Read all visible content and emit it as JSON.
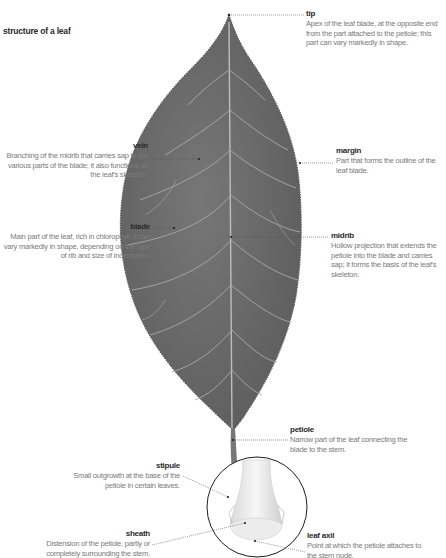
{
  "title": "structure of a leaf",
  "labels": {
    "tip": {
      "term": "tip",
      "desc": "Apex of the leaf blade, at the opposite end from the part attached to the petiole; this part can vary markedly in shape."
    },
    "margin": {
      "term": "margin",
      "desc": "Part that forms the outline of the leaf blade."
    },
    "vein": {
      "term": "vein",
      "desc": "Branching of the midrib that carries sap to the various parts of the blade; it also functions as the leaf's skeleton."
    },
    "blade": {
      "term": "blade",
      "desc": "Main part of the leaf, rich in chlorophyll; it can vary markedly in shape, depending on the type of rib and size of indentation."
    },
    "midrib": {
      "term": "midrib",
      "desc": "Hollow projection that extends the petiole into the blade and carries sap; it forms the basis of the leaf's skeleton."
    },
    "petiole": {
      "term": "petiole",
      "desc": "Narrow part of the leaf connecting the blade to the stem."
    },
    "stipule": {
      "term": "stipule",
      "desc": "Small outgrowth at the base of the petiole in certain leaves."
    },
    "sheath": {
      "term": "sheath",
      "desc": "Distension of the petiole, partly or completely surrounding the stem."
    },
    "leaf_axil": {
      "term": "leaf axil",
      "desc": "Point at which the petiole attaches to the stem node."
    }
  },
  "colors": {
    "leaf": "#6b6b6b",
    "vein": "#b9b9b9",
    "leader": "#555555",
    "term_text": "#2a2a2a",
    "desc_text": "#7a7a7a"
  }
}
